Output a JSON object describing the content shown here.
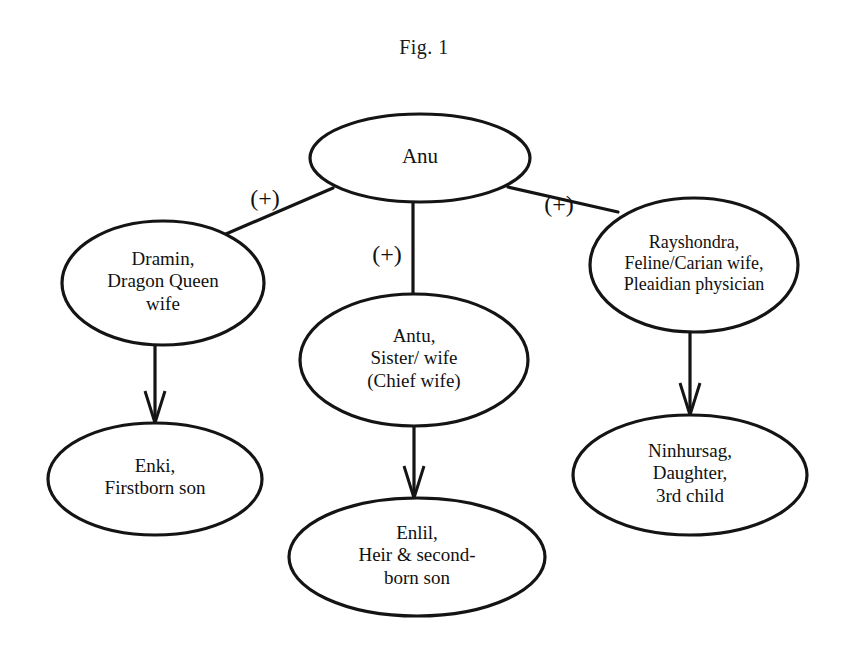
{
  "figure": {
    "title": "Fig. 1",
    "type": "family-tree-diagram",
    "line_color": "#141414",
    "background_color": "#ffffff"
  },
  "nodes": [
    {
      "id": "anu",
      "lines": [
        "Anu"
      ],
      "cx": 420,
      "cy": 158,
      "rx": 110,
      "ry": 44,
      "font_size": 21
    },
    {
      "id": "dramin",
      "lines": [
        "Dramin,",
        "Dragon Queen",
        "wife"
      ],
      "cx": 163,
      "cy": 283,
      "rx": 101,
      "ry": 62,
      "font_size": 19
    },
    {
      "id": "antu",
      "lines": [
        "Antu,",
        "Sister/ wife",
        "(Chief wife)"
      ],
      "cx": 414,
      "cy": 360,
      "rx": 114,
      "ry": 66,
      "font_size": 19
    },
    {
      "id": "rayshondra",
      "lines": [
        "Rayshondra,",
        "Feline/Carian wife,",
        "Pleaidian physician"
      ],
      "cx": 694,
      "cy": 265,
      "rx": 104,
      "ry": 67,
      "font_size": 18
    },
    {
      "id": "enki",
      "lines": [
        "Enki,",
        "Firstborn son"
      ],
      "cx": 155,
      "cy": 479,
      "rx": 107,
      "ry": 56,
      "font_size": 19
    },
    {
      "id": "enlil",
      "lines": [
        "Enlil,",
        "Heir & second-",
        "born son"
      ],
      "cx": 417,
      "cy": 557,
      "rx": 128,
      "ry": 59,
      "font_size": 19
    },
    {
      "id": "ninhursag",
      "lines": [
        "Ninhursag,",
        "Daughter,",
        "3rd child"
      ],
      "cx": 690,
      "cy": 475,
      "rx": 117,
      "ry": 60,
      "font_size": 19
    }
  ],
  "edges": [
    {
      "id": "anu-dramin",
      "from": "anu",
      "to": "dramin",
      "label": "(+)",
      "label_x": 265,
      "label_y": 206,
      "arrow": false,
      "path": "M 333 188 L 219 237"
    },
    {
      "id": "anu-antu",
      "from": "anu",
      "to": "antu",
      "label": "(+)",
      "label_x": 387,
      "label_y": 262,
      "arrow": false,
      "path": "M 413 202 L 413 294"
    },
    {
      "id": "anu-rayshondra",
      "from": "anu",
      "to": "rayshondra",
      "label": "(+)",
      "label_x": 559,
      "label_y": 212,
      "arrow": false,
      "path": "M 508 187 L 618 212"
    },
    {
      "id": "dramin-enki",
      "from": "dramin",
      "to": "enki",
      "label": "",
      "arrow": true,
      "path": "M 155 345 L 155 423"
    },
    {
      "id": "antu-enlil",
      "from": "antu",
      "to": "enlil",
      "label": "",
      "arrow": true,
      "path": "M 414 426 L 414 498"
    },
    {
      "id": "rayshondra-ninhursag",
      "from": "rayshondra",
      "to": "ninhursag",
      "label": "",
      "arrow": true,
      "path": "M 690 332 L 690 415"
    }
  ]
}
